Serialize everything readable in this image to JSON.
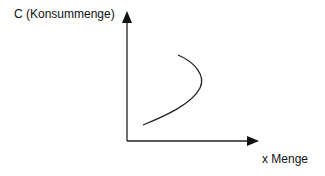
{
  "diagram": {
    "y_axis_label": "C (Konsummenge)",
    "x_axis_label": "x Menge",
    "colors": {
      "line": "#222222",
      "background": "#ffffff"
    },
    "curve": {
      "description": "backward-bending curve rising from lower-left, bulging right, and bending back toward upper-left",
      "points": [
        [
          143,
          125
        ],
        [
          180,
          107
        ],
        [
          203,
          80
        ],
        [
          178,
          55
        ]
      ]
    }
  }
}
